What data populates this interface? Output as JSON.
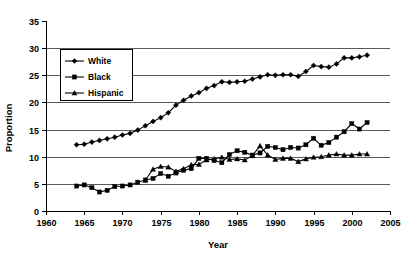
{
  "chart_data": {
    "type": "line",
    "title": "",
    "xlabel": "Year",
    "ylabel": "Proportion",
    "xlim": [
      1960,
      2005
    ],
    "ylim": [
      0,
      35
    ],
    "xticks": [
      1960,
      1965,
      1970,
      1975,
      1980,
      1985,
      1990,
      1995,
      2000,
      2005
    ],
    "yticks": [
      0,
      5,
      10,
      15,
      20,
      25,
      30,
      35
    ],
    "grid": "horizontal",
    "gridlines_at": [
      5,
      10,
      15,
      20,
      25,
      30
    ],
    "legend_position": "upper-left-inside",
    "legend_entries": [
      "White",
      "Black",
      "Hispanic"
    ],
    "series": [
      {
        "name": "White",
        "marker": "diamond",
        "x": [
          1964,
          1965,
          1966,
          1967,
          1968,
          1969,
          1970,
          1971,
          1972,
          1973,
          1974,
          1975,
          1976,
          1977,
          1978,
          1979,
          1980,
          1981,
          1982,
          1983,
          1984,
          1985,
          1986,
          1987,
          1988,
          1989,
          1990,
          1991,
          1992,
          1993,
          1994,
          1995,
          1996,
          1997,
          1998,
          1999,
          2000,
          2001,
          2002
        ],
        "values": [
          12.2,
          12.3,
          12.7,
          13.0,
          13.3,
          13.6,
          14.0,
          14.3,
          14.9,
          15.7,
          16.5,
          17.2,
          18.1,
          19.5,
          20.4,
          21.2,
          21.8,
          22.6,
          23.1,
          23.8,
          23.7,
          23.8,
          23.9,
          24.3,
          24.7,
          25.1,
          25.0,
          25.1,
          25.1,
          24.8,
          25.7,
          26.8,
          26.6,
          26.5,
          27.1,
          28.2,
          28.2,
          28.4,
          28.7
        ]
      },
      {
        "name": "Black",
        "marker": "square",
        "x": [
          1964,
          1965,
          1966,
          1967,
          1968,
          1969,
          1970,
          1971,
          1972,
          1973,
          1974,
          1975,
          1976,
          1977,
          1978,
          1979,
          1980,
          1981,
          1982,
          1983,
          1984,
          1985,
          1986,
          1987,
          1988,
          1989,
          1990,
          1991,
          1992,
          1993,
          1994,
          1995,
          1996,
          1997,
          1998,
          1999,
          2000,
          2001,
          2002
        ],
        "values": [
          4.6,
          4.8,
          4.3,
          3.5,
          3.8,
          4.5,
          4.6,
          4.8,
          5.3,
          5.7,
          6.0,
          6.9,
          6.4,
          7.0,
          7.5,
          7.8,
          9.7,
          9.7,
          9.3,
          8.9,
          10.4,
          11.1,
          10.8,
          10.3,
          10.7,
          11.9,
          11.7,
          11.3,
          11.7,
          11.6,
          12.2,
          13.4,
          12.1,
          12.6,
          13.6,
          14.6,
          16.1,
          15.1,
          16.3
        ]
      },
      {
        "name": "Hispanic",
        "marker": "triangle",
        "x": [
          1973,
          1974,
          1975,
          1976,
          1977,
          1978,
          1979,
          1980,
          1981,
          1982,
          1983,
          1984,
          1985,
          1986,
          1987,
          1988,
          1989,
          1990,
          1991,
          1992,
          1993,
          1994,
          1995,
          1996,
          1997,
          1998,
          1999,
          2000,
          2001,
          2002
        ],
        "values": [
          5.7,
          7.7,
          8.2,
          8.1,
          7.3,
          7.8,
          8.5,
          8.6,
          9.4,
          9.6,
          9.9,
          9.5,
          9.6,
          9.4,
          10.2,
          12.0,
          10.3,
          9.5,
          9.7,
          9.7,
          9.1,
          9.6,
          9.9,
          10.0,
          10.3,
          10.5,
          10.3,
          10.3,
          10.5,
          10.5
        ]
      }
    ]
  },
  "axes": {
    "y_title": "Proportion",
    "x_title": "Year",
    "y_tick_labels": [
      "0",
      "5",
      "10",
      "15",
      "20",
      "25",
      "30",
      "35"
    ],
    "x_tick_labels": [
      "1960",
      "1965",
      "1970",
      "1975",
      "1980",
      "1985",
      "1990",
      "1995",
      "2000",
      "2005"
    ]
  },
  "legend": {
    "items": [
      {
        "label": "White",
        "marker": "diamond-marker"
      },
      {
        "label": "Black",
        "marker": "square-marker"
      },
      {
        "label": "Hispanic",
        "marker": "triangle-marker"
      }
    ]
  },
  "colors": {
    "ink": "#000000",
    "grid": "#595959",
    "background": "#ffffff"
  }
}
